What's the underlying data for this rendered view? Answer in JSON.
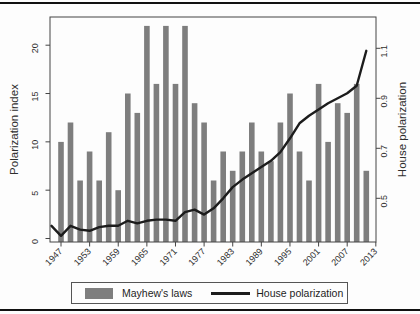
{
  "figure": {
    "legend": {
      "bar_label": "Mayhew's laws",
      "line_label": "House polarization"
    }
  },
  "chart_data": {
    "type": "bar+line",
    "title": "",
    "bar_series": {
      "name": "Mayhew's laws",
      "years": [
        1947,
        1949,
        1951,
        1953,
        1955,
        1957,
        1959,
        1961,
        1963,
        1965,
        1967,
        1969,
        1971,
        1973,
        1975,
        1977,
        1979,
        1981,
        1983,
        1985,
        1987,
        1989,
        1991,
        1993,
        1995,
        1997,
        1999,
        2001,
        2003,
        2005,
        2007,
        2009,
        2011
      ],
      "values": [
        10,
        12,
        6,
        9,
        6,
        11,
        5,
        15,
        13,
        22,
        16,
        22,
        16,
        22,
        14,
        12,
        6,
        9,
        7,
        9,
        12,
        9,
        8,
        12,
        15,
        9,
        6,
        16,
        10,
        14,
        13,
        16,
        7
      ]
    },
    "line_series": {
      "name": "House polarization",
      "years": [
        1945,
        1947,
        1949,
        1951,
        1953,
        1955,
        1957,
        1959,
        1961,
        1963,
        1965,
        1967,
        1969,
        1971,
        1973,
        1975,
        1977,
        1979,
        1981,
        1983,
        1985,
        1987,
        1989,
        1991,
        1993,
        1995,
        1997,
        1999,
        2001,
        2003,
        2005,
        2007,
        2009,
        2011
      ],
      "values": [
        0.39,
        0.35,
        0.39,
        0.375,
        0.37,
        0.385,
        0.39,
        0.39,
        0.41,
        0.4,
        0.41,
        0.415,
        0.415,
        0.41,
        0.445,
        0.455,
        0.435,
        0.46,
        0.5,
        0.545,
        0.575,
        0.6,
        0.625,
        0.65,
        0.685,
        0.74,
        0.8,
        0.83,
        0.855,
        0.88,
        0.9,
        0.92,
        0.95,
        1.09
      ]
    },
    "x_axis": {
      "tick_years": [
        1947,
        1953,
        1959,
        1965,
        1971,
        1977,
        1983,
        1989,
        1995,
        2001,
        2007,
        2013
      ],
      "tick_labels": [
        "1947",
        "1953",
        "1959",
        "1965",
        "1971",
        "1977",
        "1983",
        "1989",
        "1995",
        "2001",
        "2007",
        "2013"
      ]
    },
    "y_left": {
      "label": "Polarization index",
      "ticks": [
        0,
        5,
        10,
        15,
        20
      ],
      "tick_labels": [
        "0",
        "5",
        "10",
        "15",
        "20"
      ],
      "range": [
        0,
        22
      ]
    },
    "y_right": {
      "label": "House polarization",
      "ticks": [
        0.5,
        0.7,
        0.9,
        1.1
      ],
      "tick_labels": [
        "0.5",
        "0.7",
        "0.9",
        "1.1"
      ],
      "range": [
        0.34,
        1.18
      ]
    },
    "legend": [
      "Mayhew's laws",
      "House polarization"
    ],
    "colors": {
      "bar": "#7e7e7e",
      "line": "#1c1c1c",
      "frame": "#444444",
      "text": "#2e2e2e"
    }
  }
}
